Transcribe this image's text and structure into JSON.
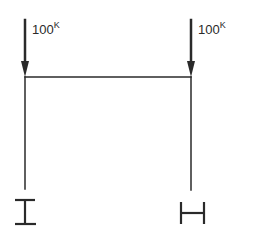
{
  "diagram": {
    "loads": [
      {
        "id": "left",
        "value": "100",
        "unit": "K"
      },
      {
        "id": "right",
        "value": "100",
        "unit": "K"
      }
    ],
    "sections": [
      {
        "id": "left-column",
        "symbol": "I",
        "orientation": "strong-axis"
      },
      {
        "id": "right-column",
        "symbol": "H",
        "orientation": "weak-axis"
      }
    ],
    "colors": {
      "line": "#2a2a2a",
      "background": "#ffffff"
    }
  }
}
